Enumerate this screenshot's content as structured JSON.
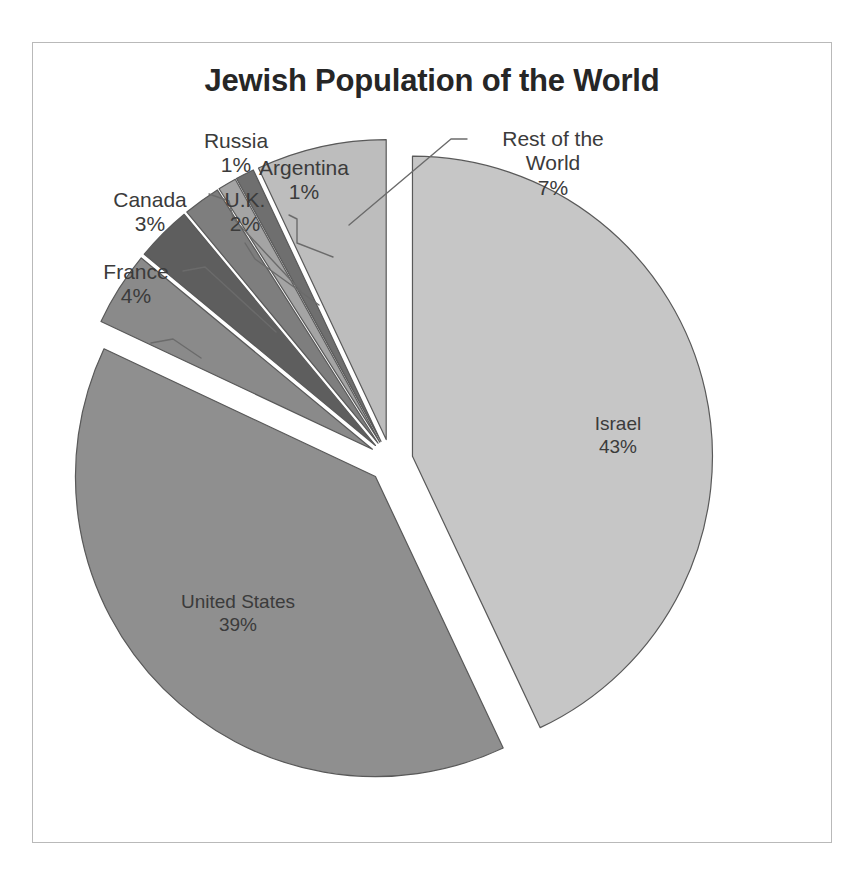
{
  "chart_data": {
    "type": "pie",
    "title": "Jewish Population of the World",
    "xlabel": "",
    "ylabel": "",
    "legend_position": "none",
    "grid": false,
    "exploded": true,
    "unit": "percent",
    "categories": [
      "Israel",
      "United States",
      "France",
      "Canada",
      "U.K.",
      "Russia",
      "Argentina",
      "Rest of the World"
    ],
    "values": [
      43,
      39,
      4,
      3,
      2,
      1,
      1,
      7
    ],
    "value_labels": [
      "43%",
      "39%",
      "4%",
      "3%",
      "2%",
      "1%",
      "1%",
      "7%"
    ],
    "slices": [
      {
        "name": "Israel",
        "value": 43,
        "value_label": "43%",
        "color": "#c6c6c6",
        "label_placement": "inside"
      },
      {
        "name": "United States",
        "value": 39,
        "value_label": "39%",
        "color": "#8f8f8f",
        "label_placement": "inside"
      },
      {
        "name": "France",
        "value": 4,
        "value_label": "4%",
        "color": "#8a8a8a",
        "label_placement": "callout"
      },
      {
        "name": "Canada",
        "value": 3,
        "value_label": "3%",
        "color": "#5e5e5e",
        "label_placement": "callout"
      },
      {
        "name": "U.K.",
        "value": 2,
        "value_label": "2%",
        "color": "#7e7e7e",
        "label_placement": "callout"
      },
      {
        "name": "Russia",
        "value": 1,
        "value_label": "1%",
        "color": "#a4a4a4",
        "label_placement": "callout"
      },
      {
        "name": "Argentina",
        "value": 1,
        "value_label": "1%",
        "color": "#6f6f6f",
        "label_placement": "callout"
      },
      {
        "name": "Rest of the World",
        "value": 7,
        "value_label": "7%",
        "color": "#bdbdbd",
        "label_placement": "callout"
      }
    ]
  },
  "title": "Jewish Population of the World",
  "labels": {
    "israel": {
      "name": "Israel",
      "value": "43%"
    },
    "united_states": {
      "name": "United States",
      "value": "39%"
    },
    "france": {
      "name": "France",
      "value": "4%"
    },
    "canada": {
      "name": "Canada",
      "value": "3%"
    },
    "uk": {
      "name": "U.K.",
      "value": "2%"
    },
    "russia": {
      "name": "Russia",
      "value": "1%"
    },
    "argentina": {
      "name": "Argentina",
      "value": "1%"
    },
    "rest_of_world": {
      "name_line1": "Rest of the",
      "name_line2": "World",
      "value": "7%"
    }
  },
  "colors": {
    "frame_border": "#b9b9b9",
    "title_text": "#262626",
    "label_text": "#3b3b3b",
    "slice_outline": "#595959",
    "background": "#ffffff"
  }
}
